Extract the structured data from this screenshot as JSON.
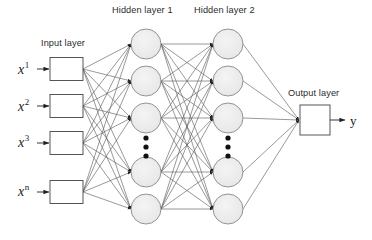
{
  "diagram": {
    "type": "neural-network",
    "background_color": "#ffffff",
    "stroke_color": "#4d4d4d",
    "node_fill_color": "#ececec",
    "node_stroke_color": "#6b6b6b",
    "box_stroke_color": "#4d4d4d",
    "text_color": "#231f20"
  },
  "labels": {
    "input_layer": "Input layer",
    "hidden_layer_1": "Hidden layer 1",
    "hidden_layer_2": "Hidden layer 2",
    "output_layer": "Output layer"
  },
  "inputs": [
    {
      "name": "x",
      "superscript": "1",
      "text": "x1"
    },
    {
      "name": "x",
      "superscript": "2",
      "text": "x2"
    },
    {
      "name": "x",
      "superscript": "3",
      "text": "x3"
    },
    {
      "name": "x",
      "superscript": "n",
      "text": "xn"
    }
  ],
  "output": {
    "text": "y"
  },
  "layers": {
    "input": {
      "count": 4,
      "shape": "rectangle",
      "box_width": 33,
      "box_height": 23,
      "x": 50,
      "centers_y": [
        69,
        106,
        143,
        192
      ]
    },
    "hidden1": {
      "count_visible": 5,
      "shape": "circle",
      "radius": 15,
      "center_x": 146,
      "centers_y": [
        44,
        81,
        118,
        172,
        209
      ],
      "ellipsis": {
        "x": 146,
        "dots": 3,
        "y_start": 138,
        "y_step": 9
      }
    },
    "hidden2": {
      "count_visible": 5,
      "shape": "circle",
      "radius": 15,
      "center_x": 228,
      "centers_y": [
        44,
        81,
        118,
        172,
        209
      ],
      "ellipsis": {
        "x": 228,
        "dots": 3,
        "y_start": 138,
        "y_step": 9
      }
    },
    "output": {
      "count": 1,
      "shape": "rectangle",
      "box_width": 30,
      "box_height": 30,
      "x": 300,
      "centers_y": [
        120
      ]
    }
  },
  "connections": {
    "input_to_hidden1": "fully-connected",
    "hidden1_to_hidden2": "fully-connected",
    "hidden2_to_output": "fully-connected",
    "arrowheads": true
  }
}
